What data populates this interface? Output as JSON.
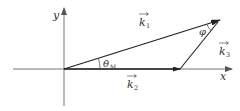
{
  "diagram": {
    "type": "vector-triangle",
    "colors": {
      "axis": "#555555",
      "vector": "#222222",
      "text": "#333333"
    },
    "axes": {
      "x_label": "x",
      "y_label": "y"
    },
    "vectors": [
      {
        "id": "k1",
        "symbol": "k",
        "subscript": "1",
        "from": "origin",
        "to": "apex"
      },
      {
        "id": "k2",
        "symbol": "k",
        "subscript": "2",
        "from": "origin",
        "to": "x-axis point"
      },
      {
        "id": "k3",
        "symbol": "k",
        "subscript": "3",
        "from": "x-axis point",
        "to": "apex"
      }
    ],
    "angles": [
      {
        "id": "theta_M",
        "symbol": "θ",
        "subscript": "M",
        "between": "k1 and k2"
      },
      {
        "id": "phi",
        "symbol": "φ",
        "between": "k1 and k3"
      }
    ]
  }
}
